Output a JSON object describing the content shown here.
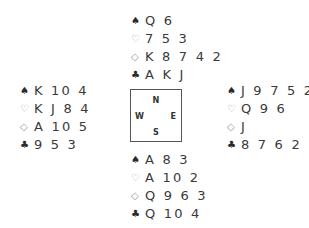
{
  "suits": {
    "spades": "♠",
    "hearts": "♡",
    "diamonds": "◇",
    "clubs": "♣"
  },
  "compass": {
    "north": "N",
    "south": "S",
    "east": "E",
    "west": "W"
  },
  "hands": {
    "north": {
      "spades": "Q 6",
      "hearts": "7 5 3",
      "diamonds": "K 8 7 4 2",
      "clubs": "A K J"
    },
    "west": {
      "spades": "K 10 4",
      "hearts": "K J 8 4",
      "diamonds": "A 10 5",
      "clubs": "9 5 3"
    },
    "east": {
      "spades": "J 9 7 5 2",
      "hearts": "Q 9 6",
      "diamonds": "J",
      "clubs": "8 7 6 2"
    },
    "south": {
      "spades": "A 8 3",
      "hearts": "A 10 2",
      "diamonds": "Q 9 6 3",
      "clubs": "Q 10 4"
    }
  }
}
